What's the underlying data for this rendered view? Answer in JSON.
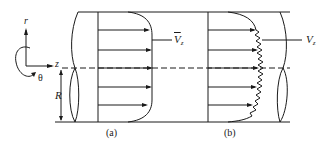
{
  "diagram": {
    "type": "velocity-profile-in-pipe",
    "colors": {
      "stroke": "#1a1a1a",
      "background": "#ffffff"
    },
    "axes": {
      "r_label": "r",
      "z_label": "z",
      "theta_label": "θ",
      "radius_label": "R"
    },
    "panel_a": {
      "caption": "(a)",
      "velocity_label_main": "V",
      "velocity_label_sub": "z",
      "velocity_label_overbar": true,
      "profile": "smooth"
    },
    "panel_b": {
      "caption": "(b)",
      "velocity_label_main": "V",
      "velocity_label_sub": "z",
      "velocity_label_overbar": false,
      "profile": "fluctuating"
    }
  }
}
